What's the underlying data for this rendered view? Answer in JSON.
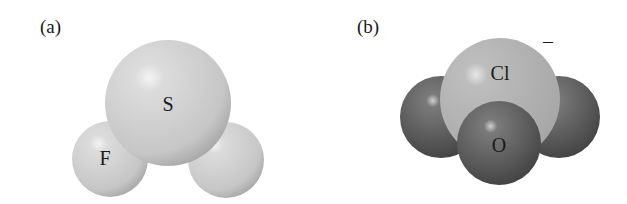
{
  "panels": [
    {
      "label": "(a)",
      "molecule": "SF2",
      "atoms": [
        {
          "symbol": "S",
          "role": "central",
          "color": "#cfcfcf"
        },
        {
          "symbol": "F",
          "role": "left",
          "color": "#c8c8c8"
        },
        {
          "symbol": "",
          "role": "right",
          "color": "#c8c8c8"
        }
      ]
    },
    {
      "label": "(b)",
      "molecule": "ClO3-",
      "charge": "–",
      "atoms": [
        {
          "symbol": "Cl",
          "role": "central",
          "color": "#b4b4b4"
        },
        {
          "symbol": "",
          "role": "left",
          "color": "#5a5a5a"
        },
        {
          "symbol": "",
          "role": "right",
          "color": "#5a5a5a"
        },
        {
          "symbol": "O",
          "role": "front",
          "color": "#5e5e5e"
        }
      ]
    }
  ]
}
